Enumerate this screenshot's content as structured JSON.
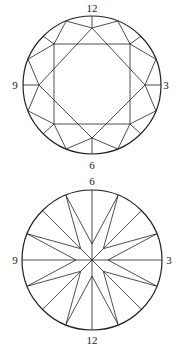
{
  "top_diagram": {
    "title": "Crown view",
    "labels": {
      "top": "12",
      "right": "3",
      "bottom": "6",
      "left": "9"
    },
    "center": [
      92,
      85
    ],
    "radius": 69
  },
  "bottom_diagram": {
    "title": "Pavilion view",
    "labels": {
      "top": "6",
      "right": "3",
      "bottom": "12",
      "left": "9"
    },
    "center": [
      92,
      84
    ],
    "radius": 70
  },
  "colors": {
    "line": "#222222",
    "background": "#ffffff"
  }
}
